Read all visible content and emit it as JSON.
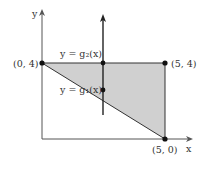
{
  "diagram": {
    "axes": {
      "x_label": "x",
      "y_label": "y"
    },
    "points": [
      {
        "label": "(0, 4)"
      },
      {
        "label": "(5, 4)"
      },
      {
        "label": "(5, 0)"
      }
    ],
    "curves": {
      "upper": "y = g₂(x)",
      "lower": "y = g₁(x)"
    },
    "region_fill": "#d0d0d0",
    "line_color": "#333333"
  }
}
